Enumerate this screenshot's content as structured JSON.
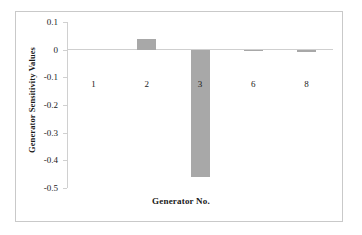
{
  "chart_data": {
    "type": "bar",
    "title": "",
    "xlabel": "Generator No.",
    "ylabel": "Generator Sensitivity Values",
    "categories": [
      "1",
      "2",
      "3",
      "6",
      "8"
    ],
    "values": [
      0,
      0.04,
      -0.46,
      -0.006,
      -0.008
    ],
    "ylim": [
      -0.5,
      0.1
    ],
    "ytick_labels": [
      "0.1",
      "0",
      "-0.1",
      "-0.2",
      "-0.3",
      "-0.4",
      "-0.5"
    ],
    "ytick_values": [
      0.1,
      0,
      -0.1,
      -0.2,
      -0.3,
      -0.4,
      -0.5
    ],
    "grid": false,
    "legend": null,
    "bar_color": "#a8a8a8",
    "axis_color": "#cfcfcf",
    "frame_color": "#c9c9c9"
  },
  "axis": {
    "y_title": "Generator Sensitivity Values",
    "x_title": "Generator No."
  },
  "ticks": {
    "y": [
      {
        "label": "0.1",
        "value": 0.1
      },
      {
        "label": "0",
        "value": 0
      },
      {
        "label": "-0.1",
        "value": -0.1
      },
      {
        "label": "-0.2",
        "value": -0.2
      },
      {
        "label": "-0.3",
        "value": -0.3
      },
      {
        "label": "-0.4",
        "value": -0.4
      },
      {
        "label": "-0.5",
        "value": -0.5
      }
    ],
    "x": [
      {
        "label": "1"
      },
      {
        "label": "2"
      },
      {
        "label": "3"
      },
      {
        "label": "6"
      },
      {
        "label": "8"
      }
    ]
  }
}
